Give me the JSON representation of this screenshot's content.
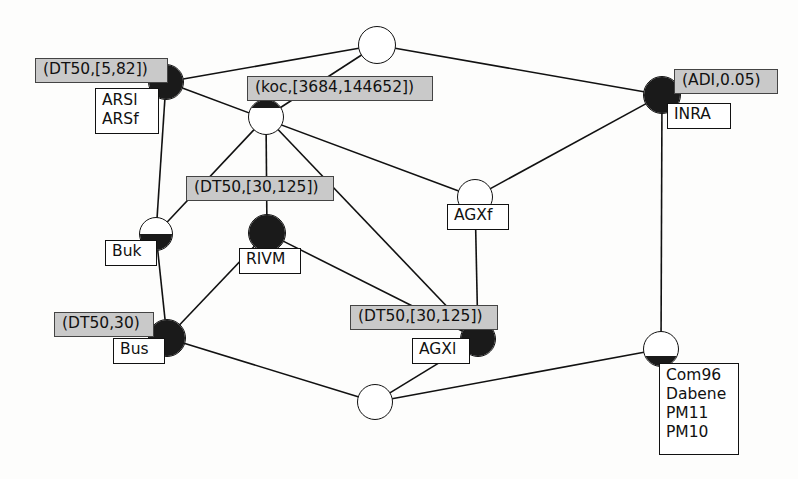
{
  "diagram": {
    "colors": {
      "node_fill": "#1a1a1a",
      "node_empty": "#ffffff",
      "property_box": "#c9c9c9",
      "stroke": "#111111"
    },
    "nodes": [
      {
        "id": "top-center",
        "label": "",
        "fill": "none",
        "cx": 377,
        "cy": 45,
        "r": 19
      },
      {
        "id": "arsl",
        "label": "ARSl\nARSf",
        "fill": "full",
        "cx": 166,
        "cy": 82,
        "r": 18
      },
      {
        "id": "koc",
        "label": "",
        "fill": "cap",
        "cx": 266,
        "cy": 117,
        "r": 18
      },
      {
        "id": "inra",
        "label": "INRA",
        "fill": "full",
        "cx": 662,
        "cy": 95,
        "r": 19
      },
      {
        "id": "buk",
        "label": "Buk",
        "fill": "half",
        "cx": 156,
        "cy": 234,
        "r": 17
      },
      {
        "id": "rivm",
        "label": "RIVM",
        "fill": "full",
        "cx": 267,
        "cy": 233,
        "r": 19
      },
      {
        "id": "agxf",
        "label": "AGXf",
        "fill": "bottom",
        "cx": 475,
        "cy": 197,
        "r": 18
      },
      {
        "id": "bus",
        "label": "Bus",
        "fill": "full",
        "cx": 167,
        "cy": 338,
        "r": 19
      },
      {
        "id": "agxl",
        "label": "AGXl",
        "fill": "full",
        "cx": 478,
        "cy": 339,
        "r": 18
      },
      {
        "id": "bottom-center",
        "label": "",
        "fill": "none",
        "cx": 375,
        "cy": 402,
        "r": 18
      },
      {
        "id": "com96",
        "label": "Com96\nDabene\nPM11\nPM10",
        "fill": "bottom",
        "cx": 661,
        "cy": 349,
        "r": 18
      }
    ],
    "node_labels": [
      {
        "for": "arsl",
        "text": "ARSl",
        "line2": "ARSf",
        "x": 95,
        "y": 88,
        "w": 64,
        "h": 46
      },
      {
        "for": "inra",
        "text": "INRA",
        "x": 667,
        "y": 103,
        "w": 64,
        "h": 26
      },
      {
        "for": "buk",
        "text": "Buk",
        "x": 105,
        "y": 240,
        "w": 52,
        "h": 26
      },
      {
        "for": "rivm",
        "text": "RIVM",
        "x": 239,
        "y": 248,
        "w": 62,
        "h": 26
      },
      {
        "for": "agxf",
        "text": "AGXf",
        "x": 447,
        "y": 204,
        "w": 62,
        "h": 26
      },
      {
        "for": "bus",
        "text": "Bus",
        "x": 113,
        "y": 338,
        "w": 52,
        "h": 26
      },
      {
        "for": "agxl",
        "text": "AGXl",
        "x": 412,
        "y": 338,
        "w": 58,
        "h": 26
      },
      {
        "for": "com96",
        "text": "Com96",
        "lines": [
          "Com96",
          "Dabene",
          "PM11",
          "PM10"
        ],
        "x": 659,
        "y": 363,
        "w": 80,
        "h": 92
      }
    ],
    "property_boxes": [
      {
        "id": "prop-dt50-5-82",
        "text": "(DT50,[5,82])",
        "x": 35,
        "y": 58,
        "w": 133,
        "h": 25
      },
      {
        "id": "prop-koc",
        "text": "(koc,[3684,144652])",
        "x": 247,
        "y": 76,
        "w": 186,
        "h": 25
      },
      {
        "id": "prop-adi",
        "text": "(ADI,0.05)",
        "x": 674,
        "y": 69,
        "w": 104,
        "h": 25
      },
      {
        "id": "prop-dt50-30-125-a",
        "text": "(DT50,[30,125])",
        "x": 186,
        "y": 176,
        "w": 148,
        "h": 25
      },
      {
        "id": "prop-dt50-30",
        "text": "(DT50,30)",
        "x": 54,
        "y": 312,
        "w": 100,
        "h": 25
      },
      {
        "id": "prop-dt50-30-125-b",
        "text": "(DT50,[30,125])",
        "x": 350,
        "y": 305,
        "w": 148,
        "h": 25
      }
    ],
    "edges": [
      {
        "from": "arsl",
        "to": "top-center"
      },
      {
        "from": "arsl",
        "to": "buk"
      },
      {
        "from": "arsl",
        "to": "agxf"
      },
      {
        "from": "top-center",
        "to": "koc"
      },
      {
        "from": "top-center",
        "to": "inra"
      },
      {
        "from": "koc",
        "to": "buk"
      },
      {
        "from": "koc",
        "to": "rivm"
      },
      {
        "from": "koc",
        "to": "agxl"
      },
      {
        "from": "inra",
        "to": "agxf"
      },
      {
        "from": "inra",
        "to": "com96"
      },
      {
        "from": "buk",
        "to": "bus"
      },
      {
        "from": "rivm",
        "to": "bus"
      },
      {
        "from": "rivm",
        "to": "agxl"
      },
      {
        "from": "agxf",
        "to": "agxl"
      },
      {
        "from": "bus",
        "to": "bottom-center"
      },
      {
        "from": "bottom-center",
        "to": "agxl"
      },
      {
        "from": "bottom-center",
        "to": "com96"
      }
    ]
  }
}
